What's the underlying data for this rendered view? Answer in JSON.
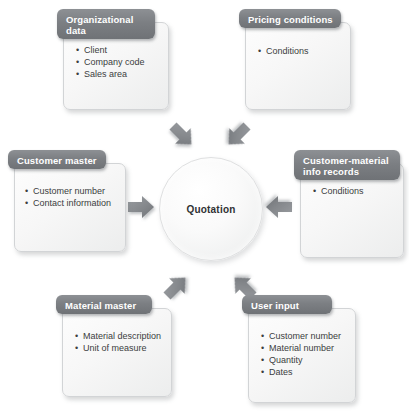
{
  "diagram": {
    "center": {
      "label": "Quotation"
    },
    "colors": {
      "header_fill": "#7c7f83",
      "body_fill": "#f7f7f7",
      "arrow_fill": "#8a8d90",
      "text": "#3b3d40",
      "header_text": "#ffffff"
    },
    "nodes": [
      {
        "id": "organizational-data",
        "title": "Organizational data",
        "items": [
          "Client",
          "Company code",
          "Sales area"
        ]
      },
      {
        "id": "pricing-conditions",
        "title": "Pricing conditions",
        "items": [
          "Conditions"
        ]
      },
      {
        "id": "customer-master",
        "title": "Customer master",
        "items": [
          "Customer number",
          "Contact information"
        ]
      },
      {
        "id": "customer-material-info-records",
        "title": "Customer-material info records",
        "items": [
          "Conditions"
        ]
      },
      {
        "id": "material-master",
        "title": "Material master",
        "items": [
          "Material description",
          "Unit of measure"
        ]
      },
      {
        "id": "user-input",
        "title": "User input",
        "items": [
          "Customer number",
          "Material number",
          "Quantity",
          "Dates"
        ]
      }
    ],
    "arrows": [
      {
        "id": "arrow-organizational-data",
        "from": "organizational-data",
        "to": "center",
        "direction": "down-right"
      },
      {
        "id": "arrow-pricing-conditions",
        "from": "pricing-conditions",
        "to": "center",
        "direction": "down-left"
      },
      {
        "id": "arrow-customer-master",
        "from": "customer-master",
        "to": "center",
        "direction": "right"
      },
      {
        "id": "arrow-customer-material-info-records",
        "from": "customer-material-info-records",
        "to": "center",
        "direction": "left"
      },
      {
        "id": "arrow-material-master",
        "from": "material-master",
        "to": "center",
        "direction": "up-right"
      },
      {
        "id": "arrow-user-input",
        "from": "user-input",
        "to": "center",
        "direction": "up-left"
      }
    ]
  }
}
